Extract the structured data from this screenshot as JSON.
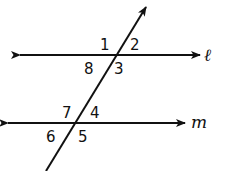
{
  "diagram": {
    "colors": {
      "stroke": "#111111",
      "background": "#ffffff"
    },
    "lines": {
      "l": {
        "label": "ℓ"
      },
      "m": {
        "label": "m"
      }
    },
    "angles": {
      "a1": "1",
      "a2": "2",
      "a3": "3",
      "a4": "4",
      "a5": "5",
      "a6": "6",
      "a7": "7",
      "a8": "8"
    }
  }
}
